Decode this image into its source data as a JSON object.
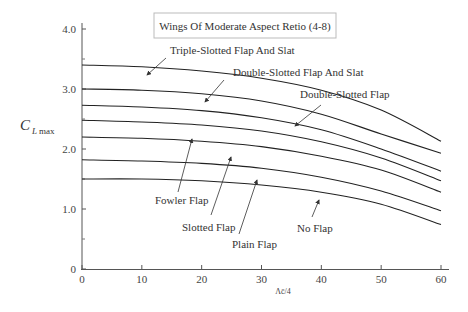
{
  "chart_data": {
    "type": "line",
    "title": "Wings Of Moderate Aspect Retio (4-8)",
    "xlabel": "Λc̄/4",
    "ylabel": "C_L max",
    "ylabel_main": "C",
    "ylabel_sub": "L max",
    "xlim": [
      0,
      60
    ],
    "ylim": [
      0,
      4.0
    ],
    "x_ticks": [
      0,
      10,
      20,
      30,
      40,
      50,
      60
    ],
    "y_ticks": [
      {
        "value": 0,
        "label": "0"
      },
      {
        "value": 1.0,
        "label": "1.0"
      },
      {
        "value": 2.0,
        "label": "2.0"
      },
      {
        "value": 3.0,
        "label": "3.0"
      },
      {
        "value": 4.0,
        "label": "4.0"
      }
    ],
    "y_minor_ticks": [
      0.5,
      1.5,
      2.5,
      3.5
    ],
    "grid": false,
    "legend": "none (annotated curves with arrows)",
    "x": [
      0,
      10,
      20,
      30,
      40,
      50,
      60
    ],
    "series": [
      {
        "name": "Triple-Slotted Flap And Slat",
        "values": [
          3.4,
          3.37,
          3.3,
          3.18,
          2.98,
          2.65,
          2.13
        ]
      },
      {
        "name": "Double-Slotted Flap And Slat",
        "values": [
          3.0,
          2.98,
          2.92,
          2.8,
          2.58,
          2.25,
          1.93
        ]
      },
      {
        "name": "Double-Slotted Flap",
        "values": [
          2.73,
          2.7,
          2.64,
          2.52,
          2.32,
          2.0,
          1.63
        ]
      },
      {
        "name": "Fowler Flap",
        "values": [
          2.48,
          2.45,
          2.4,
          2.3,
          2.12,
          1.85,
          1.47
        ]
      },
      {
        "name": "Slotted Flap",
        "values": [
          2.2,
          2.18,
          2.13,
          2.04,
          1.88,
          1.65,
          1.28
        ]
      },
      {
        "name": "Plain Flap",
        "values": [
          1.82,
          1.8,
          1.76,
          1.68,
          1.53,
          1.3,
          0.97
        ]
      },
      {
        "name": "No Flap",
        "values": [
          1.5,
          1.5,
          1.47,
          1.4,
          1.28,
          1.08,
          0.74
        ]
      }
    ],
    "annotations": [
      {
        "text": "Triple-Slotted Flap And Slat",
        "x": 170,
        "y": 54,
        "arrow": [
          [
            166,
            58
          ],
          [
            147,
            75
          ]
        ]
      },
      {
        "text": "Double-Slotted Flap And Slat",
        "x": 233,
        "y": 76,
        "arrow": [
          [
            224,
            80
          ],
          [
            205,
            102
          ]
        ]
      },
      {
        "text": "Double-Slotted Flap",
        "x": 300,
        "y": 98,
        "arrow": [
          [
            321,
            105
          ],
          [
            295,
            126
          ]
        ]
      },
      {
        "text": "Fowler Flap",
        "x": 155,
        "y": 204,
        "arrow": [
          [
            178,
            192
          ],
          [
            192,
            139
          ]
        ]
      },
      {
        "text": "Slotted Flap",
        "x": 182,
        "y": 231,
        "arrow": [
          [
            211,
            215
          ],
          [
            231,
            157
          ]
        ]
      },
      {
        "text": "Plain Flap",
        "x": 232,
        "y": 248,
        "arrow": [
          [
            239,
            234
          ],
          [
            257,
            180
          ]
        ]
      },
      {
        "text": "No Flap",
        "x": 297,
        "y": 232,
        "arrow": [
          [
            312,
            217
          ],
          [
            319,
            200
          ]
        ]
      }
    ]
  }
}
